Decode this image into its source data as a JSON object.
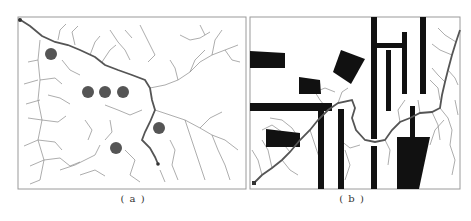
{
  "figure": {
    "panels": [
      {
        "id": "a",
        "caption": "( a )",
        "frame": {
          "x": 18,
          "y": 17,
          "w": 228,
          "h": 172
        },
        "obstacles_circles": [
          {
            "cx": 51,
            "cy": 54,
            "r": 6
          },
          {
            "cx": 88,
            "cy": 92,
            "r": 6
          },
          {
            "cx": 105,
            "cy": 92,
            "r": 6
          },
          {
            "cx": 123,
            "cy": 92,
            "r": 6
          },
          {
            "cx": 159,
            "cy": 128,
            "r": 6
          },
          {
            "cx": 116,
            "cy": 148,
            "r": 6
          }
        ],
        "path": "M19,19 L30,26 L42,36 L55,42 L68,45 L80,50 L95,57 L105,65 L118,70 L132,75 L145,80 L150,88 L152,100 L155,110 L150,122 L145,132 L142,140 L150,148 L155,157 L158,164"
      },
      {
        "id": "b",
        "caption": "( b )",
        "frame": {
          "x": 250,
          "y": 17,
          "w": 210,
          "h": 172
        },
        "path": "M254,183 L262,175 L272,168 L282,160 L290,152 L300,140 L310,130 L318,120 L328,110 L338,103 L352,100 L355,108 L352,118 L356,130 L365,140 L375,142 L385,140 L392,130 L400,122 L410,118 L420,113 L432,112 L440,108 L442,95 L445,82 L448,70 L452,55 L456,42 L460,30"
      }
    ],
    "colors": {
      "tree": "#8a8a8a",
      "path": "#555555",
      "obstacle": "#111111",
      "circle": "#555555",
      "frame": "#9a9a9a"
    }
  }
}
